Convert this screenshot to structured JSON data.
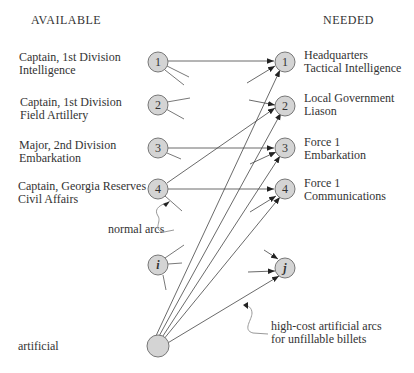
{
  "headers": {
    "left": "AVAILABLE",
    "right": "NEEDED"
  },
  "available": [
    {
      "id": "1",
      "line1": "Captain, 1st Division",
      "line2": "Intelligence"
    },
    {
      "id": "2",
      "line1": "Captain, 1st Division",
      "line2": "Field Artillery"
    },
    {
      "id": "3",
      "line1": "Major, 2nd Division",
      "line2": "Embarkation"
    },
    {
      "id": "4",
      "line1": "Captain, Georgia Reserves",
      "line2": "Civil Affairs"
    },
    {
      "id": "i",
      "line1": "",
      "line2": ""
    },
    {
      "id": "artificial",
      "line1": "artificial",
      "line2": ""
    }
  ],
  "needed": [
    {
      "id": "1",
      "line1": "Headquarters",
      "line2": "Tactical Intelligence"
    },
    {
      "id": "2",
      "line1": "Local Government",
      "line2": "Liason"
    },
    {
      "id": "3",
      "line1": "Force 1",
      "line2": "Embarkation"
    },
    {
      "id": "4",
      "line1": "Force 1",
      "line2": "Communications"
    },
    {
      "id": "j",
      "line1": "",
      "line2": ""
    }
  ],
  "annotations": {
    "normal": "normal arcs",
    "artificial_line1": "high-cost artificial arcs",
    "artificial_line2": "for unfillable billets"
  },
  "colors": {
    "node_fill": "#d4d4d4",
    "node_stroke": "#777777",
    "edge": "#444444"
  }
}
